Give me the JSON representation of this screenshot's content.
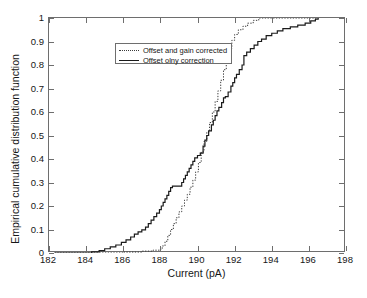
{
  "chart_data": {
    "type": "line",
    "title": "",
    "xlabel": "Current (pA)",
    "ylabel": "Empirical cumulative distribution function",
    "xlim": [
      182,
      198
    ],
    "ylim": [
      0,
      1
    ],
    "xticks": [
      182,
      184,
      186,
      188,
      190,
      192,
      194,
      196,
      198
    ],
    "xticklabels": [
      "182",
      "184",
      "186",
      "188",
      "190",
      "192",
      "194",
      "196",
      "198"
    ],
    "yticks": [
      0,
      0.1,
      0.2,
      0.3,
      0.4,
      0.5,
      0.6,
      0.7,
      0.8,
      0.9,
      1
    ],
    "yticklabels": [
      "0",
      "0.1",
      "0.2",
      "0.3",
      "0.4",
      "0.5",
      "0.6",
      "0.7",
      "0.8",
      "0.9",
      "1"
    ],
    "grid": false,
    "legend_position": "upper left",
    "series": [
      {
        "name": "Offset and gain corrected",
        "style": "dotted",
        "color": "#3a3a3a",
        "points": [
          [
            182.3,
            0.0
          ],
          [
            186.0,
            0.004
          ],
          [
            187.0,
            0.008
          ],
          [
            187.6,
            0.012
          ],
          [
            187.95,
            0.016
          ],
          [
            188.1,
            0.03
          ],
          [
            188.25,
            0.05
          ],
          [
            188.4,
            0.075
          ],
          [
            188.55,
            0.1
          ],
          [
            188.7,
            0.125
          ],
          [
            188.85,
            0.15
          ],
          [
            189.0,
            0.175
          ],
          [
            189.15,
            0.2
          ],
          [
            189.3,
            0.225
          ],
          [
            189.45,
            0.25
          ],
          [
            189.6,
            0.28
          ],
          [
            189.75,
            0.31
          ],
          [
            189.9,
            0.345
          ],
          [
            190.05,
            0.385
          ],
          [
            190.2,
            0.43
          ],
          [
            190.35,
            0.475
          ],
          [
            190.5,
            0.515
          ],
          [
            190.65,
            0.555
          ],
          [
            190.8,
            0.6
          ],
          [
            190.95,
            0.645
          ],
          [
            191.1,
            0.69
          ],
          [
            191.25,
            0.735
          ],
          [
            191.4,
            0.78
          ],
          [
            191.55,
            0.825
          ],
          [
            191.7,
            0.87
          ],
          [
            191.85,
            0.905
          ],
          [
            192.0,
            0.93
          ],
          [
            192.2,
            0.95
          ],
          [
            192.45,
            0.965
          ],
          [
            192.7,
            0.978
          ],
          [
            193.0,
            0.99
          ],
          [
            193.3,
            1.0
          ],
          [
            196.5,
            1.0
          ]
        ]
      },
      {
        "name": "Offset olny correction",
        "style": "solid",
        "color": "#1a1a1a",
        "points": [
          [
            182.3,
            0.0
          ],
          [
            184.3,
            0.005
          ],
          [
            184.7,
            0.01
          ],
          [
            185.0,
            0.018
          ],
          [
            185.3,
            0.026
          ],
          [
            185.6,
            0.034
          ],
          [
            185.9,
            0.045
          ],
          [
            186.15,
            0.056
          ],
          [
            186.4,
            0.068
          ],
          [
            186.6,
            0.08
          ],
          [
            186.8,
            0.09
          ],
          [
            187.0,
            0.098
          ],
          [
            187.2,
            0.11
          ],
          [
            187.35,
            0.125
          ],
          [
            187.5,
            0.14
          ],
          [
            187.65,
            0.155
          ],
          [
            187.8,
            0.17
          ],
          [
            187.95,
            0.185
          ],
          [
            188.05,
            0.2
          ],
          [
            188.15,
            0.215
          ],
          [
            188.25,
            0.23
          ],
          [
            188.35,
            0.245
          ],
          [
            188.45,
            0.262
          ],
          [
            188.55,
            0.278
          ],
          [
            188.65,
            0.285
          ],
          [
            189.05,
            0.285
          ],
          [
            189.15,
            0.3
          ],
          [
            189.25,
            0.315
          ],
          [
            189.35,
            0.33
          ],
          [
            189.45,
            0.345
          ],
          [
            189.55,
            0.36
          ],
          [
            189.65,
            0.375
          ],
          [
            189.75,
            0.39
          ],
          [
            189.85,
            0.405
          ],
          [
            190.0,
            0.415
          ],
          [
            190.15,
            0.425
          ],
          [
            190.3,
            0.455
          ],
          [
            190.4,
            0.48
          ],
          [
            190.5,
            0.5
          ],
          [
            190.6,
            0.52
          ],
          [
            190.75,
            0.545
          ],
          [
            190.85,
            0.565
          ],
          [
            190.95,
            0.585
          ],
          [
            191.05,
            0.605
          ],
          [
            191.15,
            0.62
          ],
          [
            191.3,
            0.64
          ],
          [
            191.4,
            0.66
          ],
          [
            191.5,
            0.665
          ],
          [
            191.65,
            0.685
          ],
          [
            191.8,
            0.71
          ],
          [
            191.9,
            0.725
          ],
          [
            192.0,
            0.745
          ],
          [
            192.1,
            0.76
          ],
          [
            192.25,
            0.78
          ],
          [
            192.4,
            0.8
          ],
          [
            192.5,
            0.84
          ],
          [
            192.65,
            0.855
          ],
          [
            192.85,
            0.87
          ],
          [
            193.05,
            0.885
          ],
          [
            193.25,
            0.9
          ],
          [
            193.45,
            0.91
          ],
          [
            193.7,
            0.925
          ],
          [
            194.0,
            0.935
          ],
          [
            194.3,
            0.945
          ],
          [
            194.6,
            0.955
          ],
          [
            195.0,
            0.962
          ],
          [
            195.4,
            0.97
          ],
          [
            195.8,
            0.978
          ],
          [
            196.1,
            0.988
          ],
          [
            196.35,
            0.995
          ],
          [
            196.5,
            1.0
          ]
        ]
      }
    ]
  },
  "legend": {
    "items": [
      {
        "label": "Offset and gain corrected",
        "style": "dotted"
      },
      {
        "label": "Offset olny correction",
        "style": "solid"
      }
    ]
  }
}
